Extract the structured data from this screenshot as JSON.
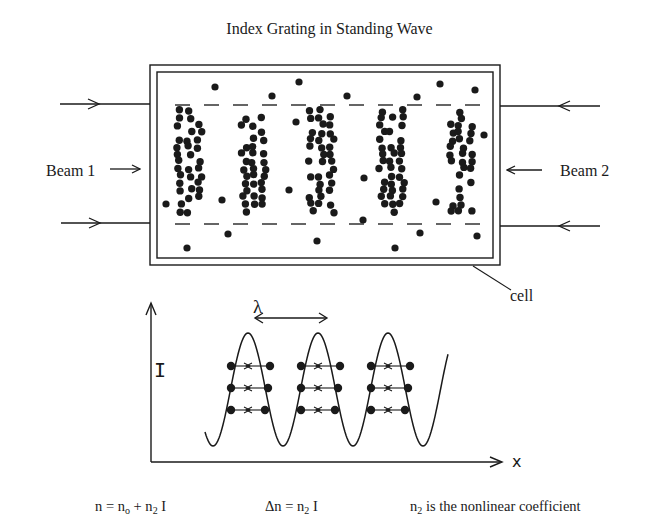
{
  "title": "Index Grating in Standing Wave",
  "labels": {
    "beam1": "Beam 1",
    "beam2": "Beam 2",
    "cell": "cell",
    "wavelength": "λ",
    "y_axis": "I",
    "x_axis": "x"
  },
  "equations": {
    "eq1": {
      "lhs": "n = n",
      "sub1": "o",
      "mid": " + n",
      "sub2": "2",
      "rhs": " I"
    },
    "eq2": {
      "lhs": "Δn = n",
      "sub1": "2",
      "rhs": " I"
    },
    "eq3": {
      "lhs": "n",
      "sub1": "2",
      "rhs": " is the nonlinear coefficient"
    }
  },
  "colors": {
    "ink": "#1a1a1a",
    "background": "#ffffff"
  },
  "diagram": {
    "cell": {
      "outer": [
        150,
        65,
        350,
        200
      ],
      "inner": [
        157,
        72,
        336,
        186
      ]
    },
    "grating_columns_x": [
      190,
      255,
      322,
      393,
      462
    ],
    "wave": {
      "x_start": 205,
      "x_end": 448,
      "peaks_x": [
        248,
        318,
        388
      ],
      "peak_y": 333,
      "trough_y": 446
    },
    "atom_rows_y": [
      366,
      388,
      410
    ]
  }
}
